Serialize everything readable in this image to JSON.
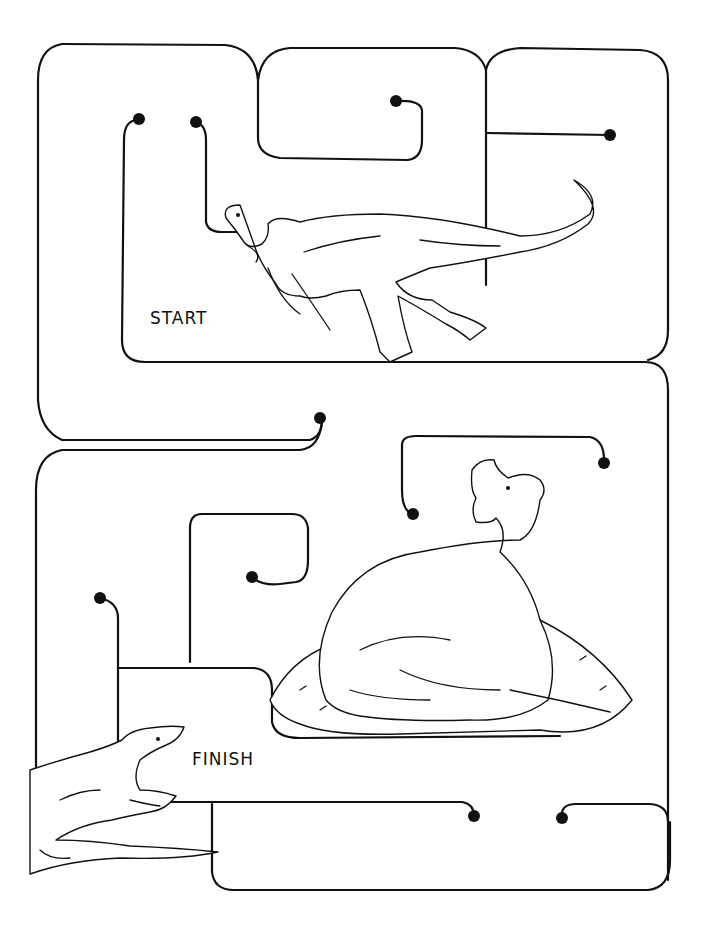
{
  "puzzle": {
    "type": "maze",
    "start_label": "START",
    "finish_label": "FINISH",
    "illustrations": [
      {
        "name": "oviraptor-running",
        "region": "top"
      },
      {
        "name": "oviraptor-on-nest",
        "region": "middle-right"
      },
      {
        "name": "lizard",
        "region": "bottom-left"
      }
    ],
    "colors": {
      "line": "#111111",
      "background": "#ffffff"
    }
  }
}
